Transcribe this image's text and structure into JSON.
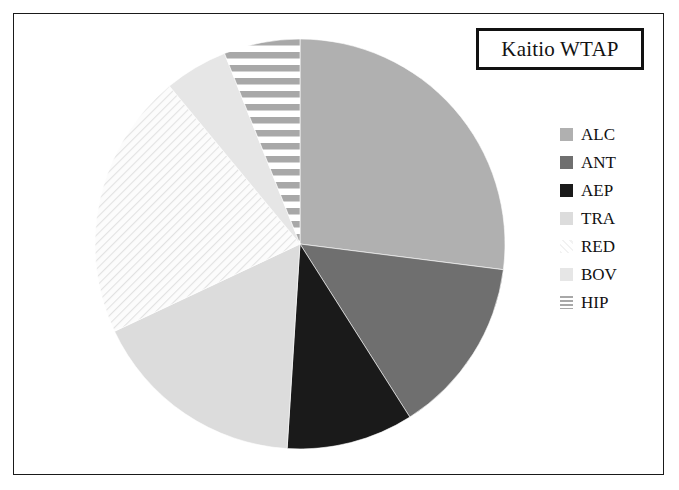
{
  "title": {
    "text": "Kaitio WTAP"
  },
  "legend": {
    "position": "right",
    "items": [
      {
        "label": "ALC",
        "color": "#b0b0b0",
        "pattern": "solid"
      },
      {
        "label": "ANT",
        "color": "#6f6f6f",
        "pattern": "solid"
      },
      {
        "label": "AEP",
        "color": "#1a1a1a",
        "pattern": "solid"
      },
      {
        "label": "TRA",
        "color": "#dcdcdc",
        "pattern": "solid"
      },
      {
        "label": "RED",
        "color": "#f2f2f2",
        "pattern": "diagonal-hatch"
      },
      {
        "label": "BOV",
        "color": "#e6e6e6",
        "pattern": "solid"
      },
      {
        "label": "HIP",
        "color": "#a8a8a8",
        "pattern": "horizontal-stripe"
      }
    ]
  },
  "chart_data": {
    "type": "pie",
    "title": "Kaitio WTAP",
    "xlabel": "",
    "ylabel": "",
    "start_angle_deg": 0,
    "direction": "clockwise",
    "categories": [
      "ALC",
      "ANT",
      "AEP",
      "TRA",
      "RED",
      "BOV",
      "HIP"
    ],
    "values": [
      27,
      14,
      10,
      17,
      21,
      5,
      6
    ],
    "units": "percent",
    "colors": [
      "#b0b0b0",
      "#6f6f6f",
      "#1a1a1a",
      "#dcdcdc",
      "#f2f2f2",
      "#e6e6e6",
      "#a8a8a8"
    ],
    "patterns": [
      "solid",
      "solid",
      "solid",
      "solid",
      "diagonal-hatch",
      "solid",
      "horizontal-stripe"
    ],
    "legend_position": "right",
    "grid": false
  },
  "geometry": {
    "center_x": 300,
    "center_y": 244,
    "radius": 205
  }
}
